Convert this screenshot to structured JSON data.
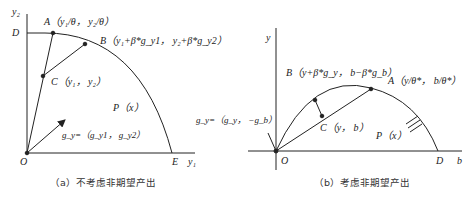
{
  "panel_a": {
    "axis_y_label": "y₂",
    "axis_x_label": "y₁",
    "point_D": "D",
    "point_E": "E",
    "point_O": "O",
    "point_A": "A（y₁/θ， y₂/θ）",
    "point_B": "B（y₁+β*g_y1， y₂+β*g_y2）",
    "point_C": "C（y₁， y₂）",
    "region": "P（x）",
    "direction_vector": "g_y=（g_y1， g_y2）",
    "caption": "（a）不考虑非期望产出"
  },
  "panel_b": {
    "axis_y_label": "y",
    "axis_x_label": "b",
    "point_D": "D",
    "point_O": "O",
    "point_A": "A（y/θ*， b/θ*）",
    "point_B": "B（y+β*g_y， b−β*g_b）",
    "point_C": "C（y， b）",
    "region": "P（x）",
    "direction_vector": "g_y=（g_y， −g_b）",
    "caption": "（b）考虑非期望产出"
  }
}
